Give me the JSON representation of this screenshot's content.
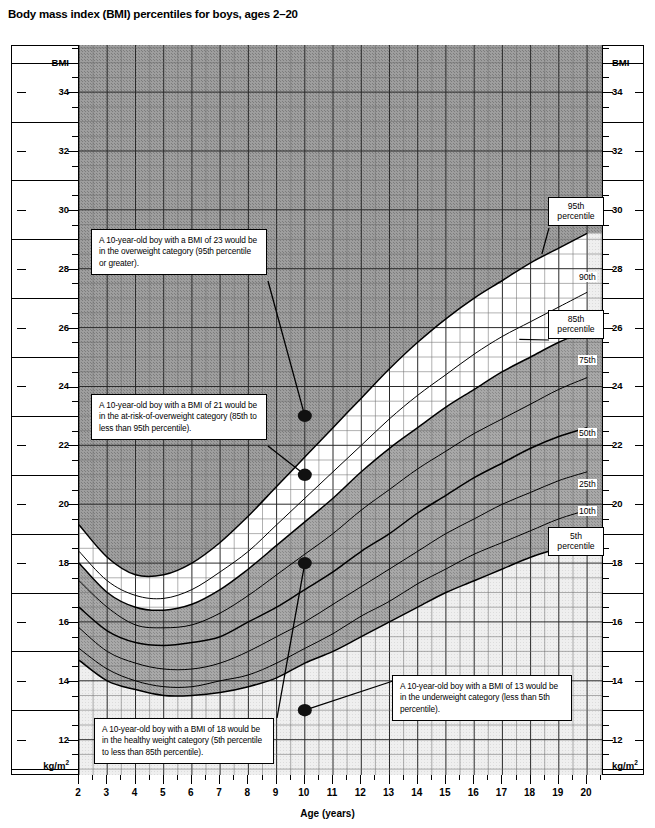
{
  "title": "Body mass index (BMI) percentiles for boys, ages 2–20",
  "axes": {
    "y_title_top": "BMI",
    "y_unit_bottom": "kg/m",
    "y_unit_exp": "2",
    "y_ticks": [
      "34",
      "32",
      "30",
      "28",
      "26",
      "24",
      "22",
      "20",
      "18",
      "16",
      "14",
      "12"
    ],
    "x_title": "Age (years)",
    "x_ticks": [
      "2",
      "3",
      "4",
      "5",
      "6",
      "7",
      "8",
      "9",
      "10",
      "11",
      "12",
      "13",
      "14",
      "15",
      "16",
      "17",
      "18",
      "19",
      "20"
    ]
  },
  "percentile_labels": {
    "p95": "95th\npercentile",
    "p95_l1": "95th",
    "p95_l2": "percentile",
    "p90": "90th",
    "p85_l1": "85th",
    "p85_l2": "percentile",
    "p75": "75th",
    "p50": "50th",
    "p25": "25th",
    "p10": "10th",
    "p5_l1": "5th",
    "p5_l2": "percentile"
  },
  "callouts": [
    {
      "id": "overweight",
      "text": "A 10-year-old boy with a BMI of 23 would be in the overweight category (95th percentile or greater)."
    },
    {
      "id": "at-risk-of-overweight",
      "text": "A 10-year-old boy with a BMI of 21 would be in the at-risk-of-overweight category (85th to less than 95th percentile)."
    },
    {
      "id": "healthy-weight",
      "text": "A 10-year-old boy with a BMI of 18 would be in the healthy weight category (5th percentile to less than 85th percentile)."
    },
    {
      "id": "underweight",
      "text": "A 10-year-old boy with a BMI of 13 would be in the underweight category (less than 5th percentile)."
    }
  ],
  "chart_data": {
    "type": "line",
    "title": "Body mass index (BMI) percentiles for boys, ages 2–20",
    "xlabel": "Age (years)",
    "ylabel": "BMI",
    "yunit": "kg/m2",
    "xlim": [
      2,
      20.6
    ],
    "ylim": [
      10.8,
      35.6
    ],
    "grid": true,
    "legend_position": "right-inline",
    "x": [
      2,
      3,
      4,
      5,
      6,
      7,
      8,
      9,
      10,
      11,
      12,
      13,
      14,
      15,
      16,
      17,
      18,
      19,
      20
    ],
    "series": [
      {
        "name": "95th",
        "values": [
          19.3,
          18.2,
          17.6,
          17.6,
          18.0,
          18.7,
          19.6,
          20.6,
          21.6,
          22.6,
          23.6,
          24.6,
          25.5,
          26.3,
          27.0,
          27.6,
          28.2,
          28.7,
          29.2
        ]
      },
      {
        "name": "90th",
        "values": [
          18.4,
          17.4,
          16.9,
          16.8,
          17.1,
          17.7,
          18.4,
          19.3,
          20.2,
          21.1,
          22.0,
          22.9,
          23.7,
          24.4,
          25.1,
          25.7,
          26.2,
          26.7,
          27.2
        ]
      },
      {
        "name": "85th",
        "values": [
          18.0,
          17.0,
          16.5,
          16.4,
          16.6,
          17.1,
          17.8,
          18.6,
          19.4,
          20.2,
          21.1,
          21.9,
          22.6,
          23.3,
          23.9,
          24.5,
          25.0,
          25.5,
          25.9
        ]
      },
      {
        "name": "75th",
        "values": [
          17.4,
          16.5,
          15.9,
          15.8,
          15.9,
          16.3,
          16.9,
          17.6,
          18.3,
          19.0,
          19.8,
          20.5,
          21.2,
          21.8,
          22.4,
          22.9,
          23.4,
          23.9,
          24.3
        ]
      },
      {
        "name": "50th",
        "values": [
          16.5,
          15.7,
          15.3,
          15.2,
          15.3,
          15.5,
          16.0,
          16.5,
          17.1,
          17.7,
          18.4,
          19.0,
          19.7,
          20.3,
          20.9,
          21.4,
          21.9,
          22.3,
          22.6
        ]
      },
      {
        "name": "25th",
        "values": [
          15.8,
          15.0,
          14.6,
          14.4,
          14.4,
          14.6,
          15.0,
          15.5,
          16.0,
          16.6,
          17.2,
          17.8,
          18.4,
          19.0,
          19.5,
          20.0,
          20.4,
          20.8,
          21.1
        ]
      },
      {
        "name": "10th",
        "values": [
          15.1,
          14.4,
          14.0,
          13.8,
          13.8,
          14.0,
          14.2,
          14.6,
          15.1,
          15.6,
          16.2,
          16.7,
          17.3,
          17.8,
          18.3,
          18.7,
          19.1,
          19.5,
          19.8
        ]
      },
      {
        "name": "5th",
        "values": [
          14.7,
          14.0,
          13.7,
          13.5,
          13.5,
          13.6,
          13.8,
          14.1,
          14.6,
          15.0,
          15.5,
          16.0,
          16.5,
          17.0,
          17.4,
          17.8,
          18.2,
          18.5,
          18.8
        ]
      }
    ],
    "bands": [
      {
        "name": "overweight",
        "above": "95th",
        "shade": "dark-gray"
      },
      {
        "name": "at-risk-of-overweight",
        "between": [
          "85th",
          "95th"
        ],
        "shade": "white"
      },
      {
        "name": "healthy-weight",
        "between": [
          "5th",
          "85th"
        ],
        "shade": "medium-gray"
      },
      {
        "name": "underweight",
        "below": "5th",
        "shade": "light-gray"
      }
    ],
    "annotations": [
      {
        "label": "overweight",
        "x": 10,
        "y": 23
      },
      {
        "label": "at-risk-of-overweight",
        "x": 10,
        "y": 21
      },
      {
        "label": "healthy-weight",
        "x": 10,
        "y": 18
      },
      {
        "label": "underweight",
        "x": 10,
        "y": 13
      }
    ]
  }
}
